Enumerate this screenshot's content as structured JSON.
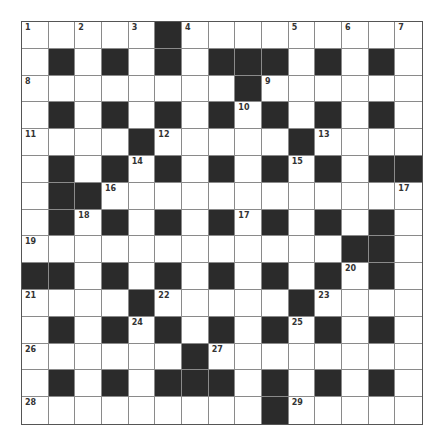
{
  "puzzle": {
    "rows": 15,
    "cols": 15,
    "colors": {
      "black_cell": "#2b2b2b",
      "white_cell": "#ffffff",
      "grid_line": "#8a8a8a"
    },
    "layout": [
      "WWWWWBWWWWWWWWW",
      "WBWBWBWBBBWBWBW",
      "WWWWWWWWBWWWWWW",
      "WBWBWBWBWBWBWBW",
      "WWWWBWWWWWBWWWW",
      "WBWBWBWBWBWBWBB",
      "WBBWWWWWWWWWWWW",
      "WBWBWBWBWBWBWBW",
      "WWWWWWWWWWWWBBW",
      "BBWBWBWBWBWBWBW",
      "WWWWBWWWWWBWWWW",
      "WBWBWBWBWBWBWBW",
      "WWWWWWBWWWWWWWW",
      "WBWBWBBBWBWBWBW",
      "WWWWWWWWWBWWWWW"
    ],
    "numbers": [
      {
        "r": 0,
        "c": 0,
        "n": "1"
      },
      {
        "r": 0,
        "c": 2,
        "n": "2"
      },
      {
        "r": 0,
        "c": 4,
        "n": "3"
      },
      {
        "r": 0,
        "c": 6,
        "n": "4"
      },
      {
        "r": 0,
        "c": 10,
        "n": "5"
      },
      {
        "r": 0,
        "c": 12,
        "n": "6"
      },
      {
        "r": 0,
        "c": 14,
        "n": "7"
      },
      {
        "r": 2,
        "c": 0,
        "n": "8"
      },
      {
        "r": 2,
        "c": 9,
        "n": "9"
      },
      {
        "r": 3,
        "c": 8,
        "n": "10"
      },
      {
        "r": 4,
        "c": 0,
        "n": "11"
      },
      {
        "r": 4,
        "c": 5,
        "n": "12"
      },
      {
        "r": 4,
        "c": 11,
        "n": "13"
      },
      {
        "r": 5,
        "c": 4,
        "n": "14"
      },
      {
        "r": 5,
        "c": 10,
        "n": "15"
      },
      {
        "r": 6,
        "c": 3,
        "n": "16"
      },
      {
        "r": 6,
        "c": 14,
        "n": "17"
      },
      {
        "r": 7,
        "c": 2,
        "n": "18"
      },
      {
        "r": 7,
        "c": 8,
        "n": "17"
      },
      {
        "r": 8,
        "c": 0,
        "n": "19"
      },
      {
        "r": 9,
        "c": 12,
        "n": "20"
      },
      {
        "r": 10,
        "c": 0,
        "n": "21"
      },
      {
        "r": 10,
        "c": 5,
        "n": "22"
      },
      {
        "r": 10,
        "c": 11,
        "n": "23"
      },
      {
        "r": 11,
        "c": 4,
        "n": "24"
      },
      {
        "r": 11,
        "c": 10,
        "n": "25"
      },
      {
        "r": 12,
        "c": 0,
        "n": "26"
      },
      {
        "r": 12,
        "c": 7,
        "n": "27"
      },
      {
        "r": 14,
        "c": 0,
        "n": "28"
      },
      {
        "r": 14,
        "c": 10,
        "n": "29"
      }
    ]
  }
}
